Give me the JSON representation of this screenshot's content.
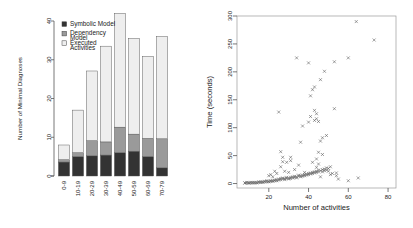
{
  "figure": {
    "panels": [
      "bar-chart-minimal-diagnoses",
      "scatter-time-vs-activities"
    ]
  },
  "chart_data": [
    {
      "type": "bar",
      "id": "minimal-diagnoses-by-activity-bucket",
      "title": "",
      "xlabel": "",
      "ylabel": "Number of Minimal Diagnoses",
      "stacked": true,
      "categories": [
        "0-9",
        "10-19",
        "20-29",
        "30-39",
        "40-49",
        "50-59",
        "60-69",
        "70-79"
      ],
      "ylim": [
        0,
        40
      ],
      "yticks": [
        0,
        10,
        20,
        30,
        40
      ],
      "ytick_labels": [
        "0",
        "10",
        "20",
        "30",
        "40"
      ],
      "grid": false,
      "legend_position": "top-left",
      "series": [
        {
          "name": "Symbolic Model",
          "color": "#333333",
          "values": [
            3.6,
            5.0,
            5.2,
            5.4,
            6.0,
            6.4,
            5.0,
            2.1
          ]
        },
        {
          "name": "Dependency Model",
          "color": "#9a9a9a",
          "values": [
            0.6,
            1.0,
            3.9,
            3.4,
            6.6,
            4.4,
            4.7,
            7.5
          ]
        },
        {
          "name": "Executed Activities",
          "color": "#eeeeee",
          "values": [
            3.8,
            11.0,
            18.0,
            24.7,
            29.4,
            24.7,
            21.2,
            26.4
          ]
        }
      ],
      "totals": [
        8.0,
        17.0,
        27.1,
        33.5,
        42.0,
        35.5,
        30.9,
        36.0
      ]
    },
    {
      "type": "scatter",
      "id": "time-vs-activities",
      "title": "",
      "xlabel": "Number of activities",
      "ylabel": "Time (seconds)",
      "marker": "x",
      "marker_color": "#555555",
      "xlim": [
        4,
        84
      ],
      "ylim": [
        -8,
        300
      ],
      "xticks": [
        20,
        40,
        60,
        80
      ],
      "xtick_labels": [
        "20",
        "40",
        "60",
        "80"
      ],
      "yticks": [
        0,
        50,
        100,
        150,
        200,
        250,
        300
      ],
      "ytick_labels": [
        "0",
        "50",
        "100",
        "150",
        "200",
        "250",
        "300"
      ],
      "grid": false,
      "box": true,
      "points": [
        [
          8,
          1
        ],
        [
          8,
          1
        ],
        [
          9,
          1
        ],
        [
          9,
          2
        ],
        [
          10,
          1
        ],
        [
          10,
          1
        ],
        [
          11,
          2
        ],
        [
          11,
          1
        ],
        [
          12,
          1
        ],
        [
          12,
          2
        ],
        [
          13,
          1
        ],
        [
          13,
          2
        ],
        [
          14,
          2
        ],
        [
          14,
          1
        ],
        [
          15,
          2
        ],
        [
          15,
          3
        ],
        [
          16,
          2
        ],
        [
          16,
          3
        ],
        [
          17,
          3
        ],
        [
          17,
          2
        ],
        [
          18,
          3
        ],
        [
          18,
          4
        ],
        [
          19,
          3
        ],
        [
          19,
          5
        ],
        [
          20,
          4
        ],
        [
          20,
          3
        ],
        [
          20,
          14
        ],
        [
          21,
          4
        ],
        [
          21,
          5
        ],
        [
          21,
          16
        ],
        [
          22,
          5
        ],
        [
          22,
          4
        ],
        [
          22,
          12
        ],
        [
          23,
          5
        ],
        [
          23,
          6
        ],
        [
          23,
          22
        ],
        [
          24,
          5
        ],
        [
          24,
          7
        ],
        [
          24,
          18
        ],
        [
          25,
          6
        ],
        [
          25,
          8
        ],
        [
          25,
          128
        ],
        [
          26,
          7
        ],
        [
          26,
          9
        ],
        [
          26,
          30
        ],
        [
          26,
          57
        ],
        [
          27,
          8
        ],
        [
          27,
          10
        ],
        [
          27,
          39
        ],
        [
          27,
          47
        ],
        [
          28,
          9
        ],
        [
          28,
          7
        ],
        [
          28,
          22
        ],
        [
          29,
          9
        ],
        [
          29,
          11
        ],
        [
          29,
          38
        ],
        [
          30,
          10
        ],
        [
          30,
          8
        ],
        [
          30,
          20
        ],
        [
          31,
          11
        ],
        [
          31,
          9
        ],
        [
          31,
          41
        ],
        [
          31,
          47
        ],
        [
          32,
          10
        ],
        [
          32,
          12
        ],
        [
          33,
          11
        ],
        [
          33,
          13
        ],
        [
          33,
          25
        ],
        [
          34,
          12
        ],
        [
          34,
          10
        ],
        [
          34,
          225
        ],
        [
          35,
          13
        ],
        [
          35,
          15
        ],
        [
          35,
          33
        ],
        [
          36,
          14
        ],
        [
          36,
          12
        ],
        [
          36,
          74
        ],
        [
          37,
          15
        ],
        [
          37,
          13
        ],
        [
          37,
          103
        ],
        [
          38,
          16
        ],
        [
          38,
          14
        ],
        [
          38,
          20
        ],
        [
          39,
          17
        ],
        [
          39,
          15
        ],
        [
          40,
          18
        ],
        [
          40,
          16
        ],
        [
          40,
          110
        ],
        [
          40,
          216
        ],
        [
          41,
          19
        ],
        [
          41,
          17
        ],
        [
          41,
          120
        ],
        [
          41,
          157
        ],
        [
          42,
          20
        ],
        [
          42,
          18
        ],
        [
          42,
          38
        ],
        [
          42,
          168
        ],
        [
          43,
          21
        ],
        [
          43,
          19
        ],
        [
          43,
          113
        ],
        [
          43,
          131
        ],
        [
          43,
          173
        ],
        [
          44,
          22
        ],
        [
          44,
          20
        ],
        [
          44,
          29
        ],
        [
          44,
          44
        ],
        [
          44,
          116
        ],
        [
          44,
          125
        ],
        [
          45,
          24
        ],
        [
          45,
          21
        ],
        [
          45,
          35
        ],
        [
          45,
          56
        ],
        [
          45,
          111
        ],
        [
          46,
          23
        ],
        [
          46,
          12
        ],
        [
          46,
          76
        ],
        [
          46,
          186
        ],
        [
          47,
          25
        ],
        [
          47,
          21
        ],
        [
          47,
          52
        ],
        [
          47,
          82
        ],
        [
          48,
          26
        ],
        [
          48,
          23
        ],
        [
          48,
          201
        ],
        [
          49,
          28
        ],
        [
          49,
          24
        ],
        [
          49,
          86
        ],
        [
          50,
          27
        ],
        [
          50,
          22
        ],
        [
          51,
          30
        ],
        [
          51,
          16
        ],
        [
          52,
          18
        ],
        [
          53,
          134
        ],
        [
          53,
          218
        ],
        [
          54,
          19
        ],
        [
          54,
          14
        ],
        [
          55,
          8
        ],
        [
          60,
          5
        ],
        [
          60,
          225
        ],
        [
          64,
          290
        ],
        [
          65,
          10
        ],
        [
          73,
          257
        ]
      ]
    }
  ],
  "bar_chart": {
    "legend": {
      "items": [
        {
          "label": "Symbolic Model",
          "swatch": "filled-dark-square"
        },
        {
          "label": "Dependency Model",
          "swatch": "filled-gray-square"
        },
        {
          "label": "Executed Activities",
          "swatch": "empty-square"
        }
      ]
    },
    "axis": {
      "y_title": "Number of Minimal Diagnoses"
    }
  },
  "scatter_chart": {
    "axis": {
      "x_title": "Number of activities",
      "y_title": "Time (seconds)"
    }
  },
  "colors": {
    "symbolic_model": "#333333",
    "dependency_model": "#9a9a9a",
    "executed_activities": "#eeeeee",
    "axis": "#555555",
    "marker": "#555555",
    "background": "#ffffff"
  }
}
